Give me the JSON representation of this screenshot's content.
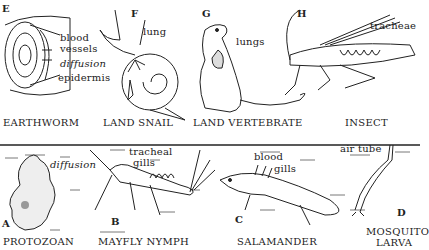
{
  "figure": {
    "top_row": [
      {
        "letter": "E",
        "name": "EARTHWORM",
        "labels": [
          "blood",
          "vessels",
          "diffusion",
          "epidermis"
        ]
      },
      {
        "letter": "F",
        "name": "LAND SNAIL",
        "labels": [
          "lung"
        ]
      },
      {
        "letter": "G",
        "name": "LAND VERTEBRATE",
        "labels": [
          "lungs"
        ]
      },
      {
        "letter": "H",
        "name": "INSECT",
        "labels": [
          "tracheae"
        ]
      }
    ],
    "bottom_row": [
      {
        "letter": "A",
        "name": "PROTOZOAN",
        "labels": [
          "diffusion"
        ]
      },
      {
        "letter": "B",
        "name": "MAYFLY NYMPH",
        "labels": [
          "tracheal",
          "gills"
        ]
      },
      {
        "letter": "C",
        "name": "SALAMANDER",
        "labels": [
          "blood",
          "gills"
        ]
      },
      {
        "letter": "D",
        "name": "MOSQUITO",
        "name2": "LARVA",
        "labels": [
          "air tube"
        ]
      }
    ]
  }
}
